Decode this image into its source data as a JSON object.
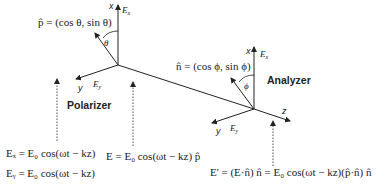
{
  "polarizer": {
    "label": "Polarizer",
    "axis_x": "x",
    "axis_y": "y",
    "field_x": "E",
    "field_x_sub": "x",
    "field_y": "E",
    "field_y_sub": "y",
    "angle": "θ",
    "vector_eq": "p̂ = (cos θ, sin θ)"
  },
  "analyzer": {
    "label": "Analyzer",
    "axis_x": "x",
    "axis_y": "y",
    "axis_z": "z",
    "field_x": "E",
    "field_x_sub": "x",
    "field_y": "E",
    "field_y_sub": "y",
    "angle": "ϕ",
    "vector_eq": "n̂ = (cos ϕ, sin ϕ)"
  },
  "equations": {
    "ex": "Eₓ = E₀ cos(ωt − kz)",
    "ey": "Eᵧ = E₀ cos(ωt − kz)",
    "e_polarized": "E = E₀ cos(ωt − kz) p̂",
    "e_analyzed": "E' = (E·n̂) n̂ = E₀ cos(ωt − kz)(p̂·n̂) n̂"
  }
}
